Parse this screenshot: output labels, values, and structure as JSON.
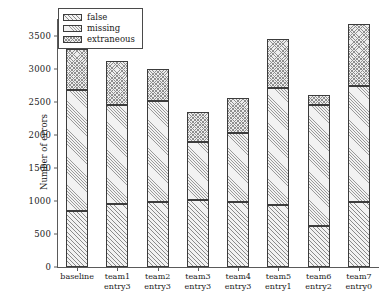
{
  "chart_data": {
    "type": "bar",
    "subtype": "stacked-bar",
    "title": "",
    "xlabel": "",
    "ylabel": "Number of errors",
    "ylim": [
      0,
      3750
    ],
    "yticks": [
      0,
      500,
      1000,
      1500,
      2000,
      2500,
      3000,
      3500
    ],
    "ytick_labels": [
      "0",
      "500",
      "1000",
      "1500",
      "2000",
      "2500",
      "3000",
      "3500"
    ],
    "grid": false,
    "legend_position": "upper left",
    "categories": [
      "baseline",
      "team1 entry3",
      "team2 entry3",
      "team3 entry3",
      "team4 entry3",
      "team5 entry1",
      "team6 entry2",
      "team7 entry0"
    ],
    "category_lines": [
      [
        "baseline",
        ""
      ],
      [
        "team1",
        "entry3"
      ],
      [
        "team2",
        "entry3"
      ],
      [
        "team3",
        "entry3"
      ],
      [
        "team4",
        "entry3"
      ],
      [
        "team5",
        "entry1"
      ],
      [
        "team6",
        "entry2"
      ],
      [
        "team7",
        "entry0"
      ]
    ],
    "series": [
      {
        "name": "false",
        "values": [
          840,
          950,
          980,
          1010,
          990,
          930,
          620,
          980
        ]
      },
      {
        "name": "missing",
        "values": [
          1830,
          1500,
          1530,
          880,
          1040,
          1770,
          1830,
          1760
        ]
      },
      {
        "name": "extraneous",
        "values": [
          630,
          670,
          490,
          460,
          520,
          750,
          150,
          930
        ]
      }
    ],
    "totals": [
      3300,
      3120,
      3000,
      2350,
      2550,
      3450,
      2600,
      3670
    ]
  },
  "legend": {
    "items": [
      {
        "label": "false",
        "swatch": "hatch-diagonal-dense"
      },
      {
        "label": "missing",
        "swatch": "hatch-diagonal-fine"
      },
      {
        "label": "extraneous",
        "swatch": "hatch-crosshatch"
      }
    ]
  },
  "colors": {
    "background": "#ffffff",
    "axis": "#5a5a5a",
    "bar_edge": "#3c3c3c",
    "bar_fill": "#f2f2f2",
    "hatch": "#8a8a8a",
    "text": "#1a1a1a"
  }
}
